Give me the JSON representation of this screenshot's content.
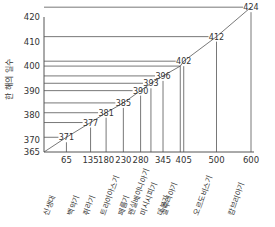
{
  "chart_data": {
    "type": "line",
    "title": "",
    "xlabel": "",
    "ylabel": "한 해의 일수",
    "xlim": [
      0,
      600
    ],
    "ylim": [
      365,
      420
    ],
    "y_ticks": [
      365,
      370,
      380,
      390,
      400,
      410,
      420
    ],
    "x_tick_labels": [
      "65",
      "135",
      "180",
      "230",
      "280",
      "345",
      "405",
      "500",
      "600"
    ],
    "categories": [
      "신생대",
      "백악기",
      "쥐라기",
      "트라이아스기",
      "페름기",
      "펜실베이니아기",
      "미시시피기",
      "데본기",
      "실루리아기",
      "오르도비스기",
      "캄브리아기"
    ],
    "x": [
      65,
      135,
      180,
      230,
      280,
      310,
      345,
      395,
      405,
      500,
      600
    ],
    "values": [
      371,
      377,
      381,
      385,
      390,
      393,
      396,
      400,
      402,
      412,
      424
    ],
    "point_labels": [
      "371",
      "377",
      "381",
      "385",
      "390",
      "393",
      "396",
      "",
      "402",
      "412",
      "424"
    ],
    "grid": false,
    "legend": null,
    "colors": {
      "line": "#555555",
      "text": "#333333"
    }
  }
}
